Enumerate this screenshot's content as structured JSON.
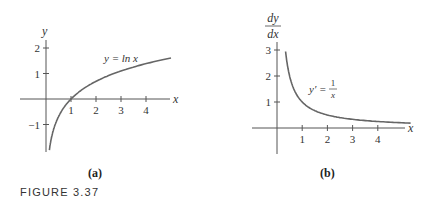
{
  "figure": {
    "caption": "FIGURE 3.37"
  },
  "chart_data": [
    {
      "type": "line",
      "panel_label": "(a)",
      "title": "",
      "xlabel": "x",
      "ylabel": "y",
      "annotation": "y = ln x",
      "function": "ln(x)",
      "x_ticks": [
        1,
        2,
        3,
        4
      ],
      "y_ticks": [
        -1,
        1,
        2
      ],
      "xlim": [
        -1.2,
        5.0
      ],
      "ylim": [
        -2.0,
        2.3
      ],
      "grid": false,
      "series": [
        {
          "name": "y = ln x",
          "x": [
            0.13,
            0.2,
            0.3,
            0.5,
            0.75,
            1,
            1.5,
            2,
            2.5,
            3,
            3.5,
            4,
            4.5,
            5
          ],
          "y": [
            -2.04,
            -1.61,
            -1.2,
            -0.69,
            -0.29,
            0,
            0.41,
            0.69,
            0.92,
            1.1,
            1.25,
            1.39,
            1.5,
            1.61
          ]
        }
      ]
    },
    {
      "type": "line",
      "panel_label": "(b)",
      "title": "",
      "xlabel": "x",
      "ylabel": "dy/dx",
      "ylabel_num": "dy",
      "ylabel_den": "dx",
      "annotation_lhs": "y′ =",
      "annotation_num": "1",
      "annotation_den": "x",
      "function": "1/x",
      "x_ticks": [
        1,
        2,
        3,
        4
      ],
      "y_ticks": [
        1,
        2,
        3
      ],
      "xlim": [
        -1.2,
        5.0
      ],
      "ylim": [
        -0.5,
        3.5
      ],
      "grid": false,
      "series": [
        {
          "name": "y' = 1/x",
          "x": [
            0.33,
            0.4,
            0.5,
            0.6,
            0.75,
            1,
            1.25,
            1.5,
            2,
            2.5,
            3,
            3.5,
            4,
            4.5,
            5
          ],
          "y": [
            3.03,
            2.5,
            2.0,
            1.67,
            1.33,
            1.0,
            0.8,
            0.67,
            0.5,
            0.4,
            0.33,
            0.29,
            0.25,
            0.22,
            0.2
          ]
        }
      ]
    }
  ]
}
